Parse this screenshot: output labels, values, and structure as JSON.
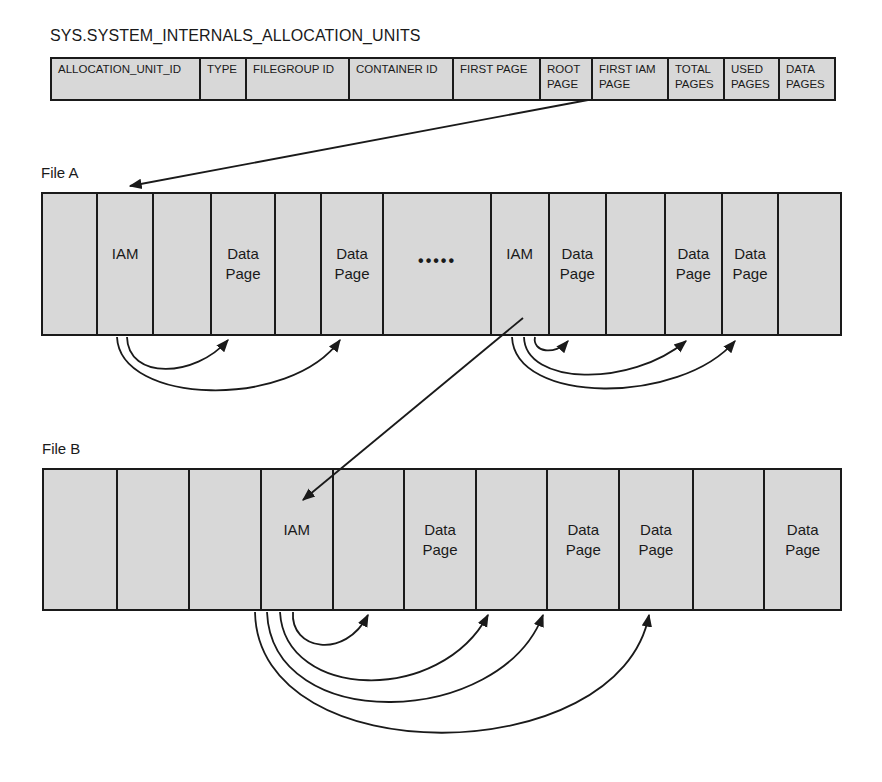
{
  "table": {
    "title": "SYS.SYSTEM_INTERNALS_ALLOCATION_UNITS",
    "columns": [
      {
        "label": "ALLOCATION_UNIT_ID"
      },
      {
        "label": "TYPE"
      },
      {
        "label": "FILEGROUP ID"
      },
      {
        "label": "CONTAINER ID"
      },
      {
        "label": "FIRST PAGE"
      },
      {
        "label": "ROOT\nPAGE"
      },
      {
        "label": "FIRST IAM\nPAGE"
      },
      {
        "label": "TOTAL\nPAGES"
      },
      {
        "label": "USED\nPAGES"
      },
      {
        "label": "DATA\nPAGES"
      }
    ]
  },
  "file_a": {
    "label": "File A",
    "pages": [
      {
        "label": ""
      },
      {
        "label": "IAM"
      },
      {
        "label": ""
      },
      {
        "label": "Data\nPage"
      },
      {
        "label": ""
      },
      {
        "label": "Data\nPage"
      },
      {
        "label": "",
        "ellipsis": "•••••"
      },
      {
        "label": ""
      },
      {
        "label": "IAM"
      },
      {
        "label": "Data\nPage"
      },
      {
        "label": ""
      },
      {
        "label": "Data\nPage"
      },
      {
        "label": "Data\nPage"
      },
      {
        "label": ""
      }
    ]
  },
  "file_b": {
    "label": "File B",
    "pages": [
      {
        "label": ""
      },
      {
        "label": ""
      },
      {
        "label": ""
      },
      {
        "label": "IAM"
      },
      {
        "label": ""
      },
      {
        "label": "Data\nPage"
      },
      {
        "label": ""
      },
      {
        "label": "Data\nPage"
      },
      {
        "label": "Data\nPage"
      },
      {
        "label": ""
      },
      {
        "label": "Data\nPage"
      }
    ]
  },
  "colors": {
    "page_fill": "#d8d8d8",
    "stroke": "#1a1a1a",
    "background": "#ffffff"
  }
}
